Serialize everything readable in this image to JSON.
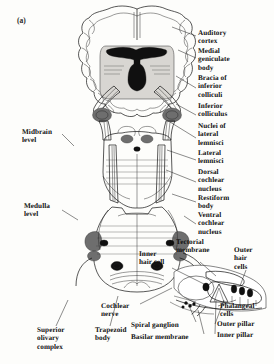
{
  "figure": {
    "panel_label": "(a)"
  },
  "labels_left": [
    {
      "id": "midbrain-level",
      "text": "Midbrain\nlevel",
      "x": 22,
      "y": 128
    },
    {
      "id": "medulla-level",
      "text": "Medulla\nlevel",
      "x": 24,
      "y": 202
    }
  ],
  "labels_right": [
    {
      "id": "auditory-cortex",
      "text": "Auditory\ncortex",
      "x": 198,
      "y": 33
    },
    {
      "id": "medial-geniculate-body",
      "text": "Medial\ngeniculate\nbody",
      "x": 198,
      "y": 52
    },
    {
      "id": "bracia-of-inferior-colliculi",
      "text": "Bracia of\ninferior\ncolliculi",
      "x": 198,
      "y": 80
    },
    {
      "id": "inferior-colliculus",
      "text": "Inferior\ncolliculus",
      "x": 198,
      "y": 109
    },
    {
      "id": "nuclei-of-lateral-lemnisci",
      "text": "Nuclei of\nlateral\nlemnisci",
      "x": 198,
      "y": 128
    },
    {
      "id": "lateral-lemnisci",
      "text": "Lateral\nlemnisci",
      "x": 198,
      "y": 153
    },
    {
      "id": "dorsal-cochlear-nucleus",
      "text": "Dorsal\ncochlear\nnucleus",
      "x": 198,
      "y": 172
    },
    {
      "id": "restiform-body",
      "text": "Restiform\nbody",
      "x": 198,
      "y": 197
    },
    {
      "id": "ventral-cochlear-nucleus",
      "text": "Ventral\ncochlear\nnucleus",
      "x": 198,
      "y": 214
    }
  ],
  "labels_cochlea": [
    {
      "id": "tectorial-membrane",
      "text": "Tectorial\nmembrane",
      "x": 176,
      "y": 243
    },
    {
      "id": "inner-hair-cell",
      "text": "Inner\nhair cell",
      "x": 141,
      "y": 253
    },
    {
      "id": "outer-hair-cells",
      "text": "Outer\nhair\ncells",
      "x": 233,
      "y": 251
    },
    {
      "id": "phalangeal-cells",
      "text": "Phalangeal\ncells",
      "x": 220,
      "y": 306
    },
    {
      "id": "outer-pillar",
      "text": "Outer pillar",
      "x": 217,
      "y": 325
    },
    {
      "id": "inner-pillar",
      "text": "Inner pillar",
      "x": 217,
      "y": 336
    }
  ],
  "labels_bottom": [
    {
      "id": "cochlear-nerve",
      "text": "Cochlear\nnerve",
      "x": 101,
      "y": 305
    },
    {
      "id": "superior-olivary-complex",
      "text": "Superior\nolivary\ncomplex",
      "x": 37,
      "y": 330
    },
    {
      "id": "trapezoid-body",
      "text": "Trapezoid\nbody",
      "x": 95,
      "y": 330
    },
    {
      "id": "spiral-ganglion",
      "text": "Spiral ganglion",
      "x": 131,
      "y": 325
    },
    {
      "id": "basilar-membrane",
      "text": "Basilar membrane",
      "x": 131,
      "y": 337
    }
  ],
  "colors": {
    "ink": "#111111",
    "paper": "#fdfdfb",
    "tissue_light": "#d8d6d2",
    "tissue_mid": "#6e6e6e"
  }
}
